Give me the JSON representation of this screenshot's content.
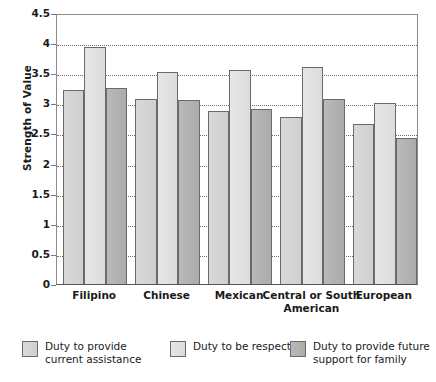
{
  "chart_data": {
    "type": "bar",
    "title": "",
    "xlabel": "",
    "ylabel": "Strength of Value",
    "ylim": [
      0,
      4.5
    ],
    "ytick_values": [
      0,
      0.5,
      1,
      1.5,
      2,
      2.5,
      3,
      3.5,
      4,
      4.5
    ],
    "ytick_labels": [
      "0",
      "0.5",
      "1",
      "1.5",
      "2",
      "2.5",
      "3",
      "3.5",
      "4",
      "4.5"
    ],
    "grid": true,
    "legend_position": "bottom",
    "categories": [
      "Filipino",
      "Chinese",
      "Mexican",
      "Central or South American",
      "European"
    ],
    "series": [
      {
        "name": "Duty to provide current assistance",
        "color": "#d4d4d4",
        "values": [
          3.22,
          3.07,
          2.88,
          2.77,
          2.66
        ]
      },
      {
        "name": "Duty to be respectful",
        "color": "#e1e1e1",
        "values": [
          3.93,
          3.52,
          3.55,
          3.6,
          3.0
        ]
      },
      {
        "name": "Duty to provide future support for family",
        "color": "#b0b0b0",
        "values": [
          3.26,
          3.05,
          2.9,
          3.07,
          2.42
        ]
      }
    ]
  },
  "axis": {
    "y_title": "Strength of Value"
  },
  "legend": {
    "items": [
      {
        "label": "Duty to provide\ncurrent assistance"
      },
      {
        "label": "Duty to be respectful"
      },
      {
        "label": "Duty to provide future\nsupport for family"
      }
    ]
  }
}
